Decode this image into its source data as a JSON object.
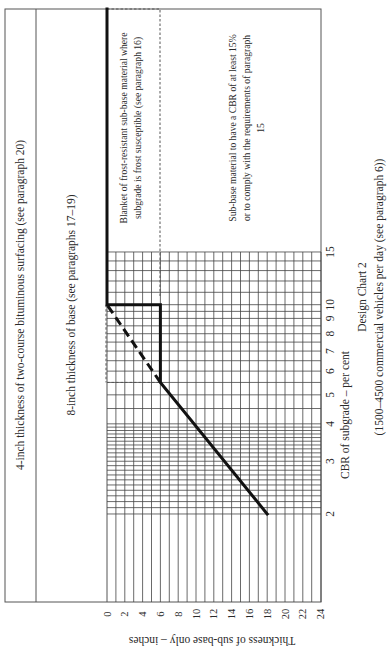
{
  "chart_data": {
    "type": "line",
    "title": "Design Chart 2",
    "subtitle": "(1500–4500 commercial vehicles per day (see paragraph 6))",
    "orientation": "rotated 90° counter-clockwise on page",
    "xlabel": "CBR of subgrade – per cent",
    "ylabel": "Thickness of sub-base only – inches",
    "x_scale": "log",
    "x_ticks": [
      2,
      3,
      4,
      5,
      6,
      7,
      8,
      9,
      10,
      15
    ],
    "x_range": [
      2,
      15
    ],
    "y_ticks": [
      0,
      2,
      4,
      6,
      8,
      10,
      12,
      14,
      16,
      18,
      20,
      22,
      24
    ],
    "y_range": [
      0,
      24
    ],
    "y_inverted": true,
    "grid": true,
    "series": [
      {
        "name": "Sub-base thickness (design curve)",
        "style": "bold solid",
        "points": [
          {
            "cbr": 2,
            "thickness": 18
          },
          {
            "cbr": 5.5,
            "thickness": 6
          },
          {
            "cbr": 10,
            "thickness": 6
          },
          {
            "cbr": 10,
            "thickness": 0
          },
          {
            "cbr": 15,
            "thickness": 0
          },
          {
            "cbr": 30,
            "thickness": 0
          }
        ]
      },
      {
        "name": "Extrapolated curve",
        "style": "bold dashed",
        "points": [
          {
            "cbr": 5.5,
            "thickness": 6
          },
          {
            "cbr": 10,
            "thickness": 0
          }
        ]
      }
    ],
    "annotations": [
      "4-inch thickness of two-course bituminous surfacing (see paragraph 20)",
      "8-inch thickness of base (see paragraphs 17–19)",
      "Blanket of frost-resistant sub-base material where subgrade is frost susceptible (see paragraph 16)",
      "Sub-base material to have a CBR of at least 15% or to comply with the requirements of paragraph 15"
    ]
  },
  "layers": {
    "surfacing": "4-inch thickness of two-course bituminous surfacing (see paragraph 20)",
    "base": "8-inch thickness of base (see paragraphs 17–19)"
  },
  "notes": {
    "frost_line1": "Blanket of frost-resistant sub-base material where",
    "frost_line2": "subgrade is frost susceptible (see paragraph 16)",
    "subbase_line1": "Sub-base material to have a CBR of at least 15%",
    "subbase_line2": "or to comply with the requirements of paragraph",
    "subbase_line3": "15"
  },
  "axes": {
    "thickness_label": "Thickness of sub-base only – inches",
    "cbr_label": "CBR of subgrade – per cent",
    "thickness_ticks": [
      "0",
      "2",
      "4",
      "6",
      "8",
      "10",
      "12",
      "14",
      "16",
      "18",
      "20",
      "22",
      "24"
    ],
    "cbr_ticks": [
      {
        "label": "2",
        "value": 2
      },
      {
        "label": "3",
        "value": 3
      },
      {
        "label": "4",
        "value": 4
      },
      {
        "label": "5",
        "value": 5
      },
      {
        "label": "6",
        "value": 6
      },
      {
        "label": "7",
        "value": 7
      },
      {
        "label": "8",
        "value": 8
      },
      {
        "label": "9",
        "value": 9
      },
      {
        "label": "10",
        "value": 10
      },
      {
        "label": "15",
        "value": 15
      }
    ]
  },
  "caption": {
    "title": "Design Chart 2",
    "subtitle": "(1500–4500 commercial vehicles per day (see paragraph 6))"
  }
}
